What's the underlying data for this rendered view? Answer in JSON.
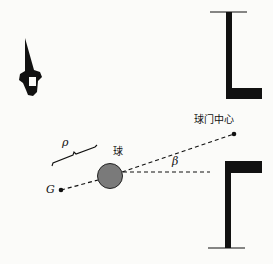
{
  "labels": {
    "goal_center": "球门中心",
    "ball": "球",
    "rho": "ρ",
    "beta": "β",
    "g": "G"
  },
  "elements": {
    "robot": "robot-icon",
    "ball": "ball-circle",
    "goal_top_post": "goal-post-top",
    "goal_bottom_post": "goal-post-bottom",
    "goal_center_point": "goal-center-dot",
    "g_point": "g-point"
  },
  "colors": {
    "ink": "#111111",
    "ball_fill": "#7a7a7a",
    "background": "#fbfbf9"
  }
}
